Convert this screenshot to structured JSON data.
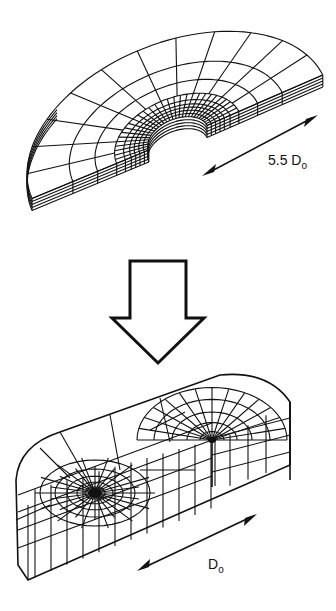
{
  "figure": {
    "top_mesh": {
      "description": "Half-annular disk finite element mesh (initial configuration)",
      "dimension_label": {
        "value": "5.5 D",
        "subscript": "o"
      }
    },
    "transition_arrow": {
      "direction": "down",
      "style": "outlined block arrow"
    },
    "bottom_mesh": {
      "description": "Deformed block finite element mesh with two refined radial regions",
      "dimension_label": {
        "value": "D",
        "subscript": "o"
      }
    },
    "colors": {
      "line": "#111111",
      "background": "#ffffff"
    }
  }
}
